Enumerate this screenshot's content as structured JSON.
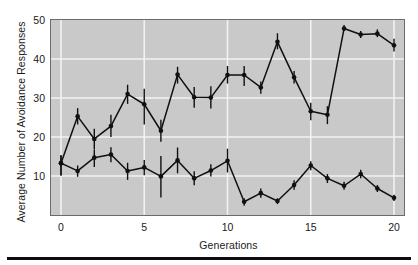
{
  "chart_data": {
    "type": "line",
    "title": "",
    "xlabel": "Generations",
    "ylabel": "Average Number of Avoidance Responses",
    "xlim": [
      -0.6,
      20.6
    ],
    "ylim": [
      0,
      50
    ],
    "xticks": [
      0,
      5,
      10,
      15,
      20
    ],
    "yticks": [
      10,
      20,
      30,
      40,
      50
    ],
    "grid": true,
    "grid_color": "#f2f2f2",
    "plot_background": "#c9c9c9",
    "series_color": "#101010",
    "marker": "filled-circle",
    "errorbars": true,
    "legend": "none",
    "x": [
      0,
      1,
      2,
      3,
      4,
      5,
      6,
      7,
      8,
      9,
      10,
      11,
      12,
      13,
      14,
      15,
      16,
      17,
      18,
      19,
      20
    ],
    "series": [
      {
        "name": "high-avoidance-line",
        "values": [
          13.3,
          25.3,
          19.5,
          22.8,
          31.0,
          28.4,
          21.6,
          36.0,
          30.2,
          30.1,
          35.9,
          35.9,
          32.7,
          44.4,
          35.3,
          26.6,
          25.7,
          47.8,
          46.3,
          46.5,
          43.5
        ],
        "err_low": [
          3.2,
          2.1,
          2.7,
          2.8,
          2.5,
          5.2,
          2.8,
          2.3,
          2.7,
          2.8,
          2.2,
          2.8,
          1.6,
          1.9,
          1.6,
          2.3,
          2.4,
          0.6,
          0.9,
          0.9,
          1.6
        ],
        "err_high": [
          2.0,
          2.1,
          2.6,
          2.9,
          2.4,
          4.0,
          2.8,
          2.0,
          2.6,
          2.9,
          2.3,
          2.3,
          1.5,
          2.2,
          1.6,
          2.2,
          2.2,
          0.9,
          0.9,
          1.1,
          1.7
        ]
      },
      {
        "name": "low-avoidance-line",
        "values": [
          13.3,
          11.3,
          14.7,
          15.5,
          11.3,
          12.2,
          9.9,
          14.0,
          9.4,
          11.4,
          13.9,
          3.4,
          5.6,
          3.6,
          7.7,
          12.7,
          9.4,
          7.5,
          10.5,
          6.8,
          4.4
        ],
        "err_low": [
          3.2,
          1.5,
          2.4,
          2.0,
          2.3,
          2.0,
          5.4,
          3.3,
          1.8,
          1.5,
          3.0,
          1.0,
          1.2,
          0.8,
          1.2,
          1.2,
          1.2,
          1.0,
          1.1,
          0.9,
          0.8
        ],
        "err_high": [
          2.0,
          1.4,
          2.0,
          1.9,
          2.1,
          1.9,
          5.2,
          3.3,
          1.8,
          1.6,
          3.1,
          0.9,
          1.2,
          0.7,
          1.2,
          1.1,
          1.1,
          1.0,
          1.1,
          0.9,
          0.8
        ]
      }
    ]
  }
}
